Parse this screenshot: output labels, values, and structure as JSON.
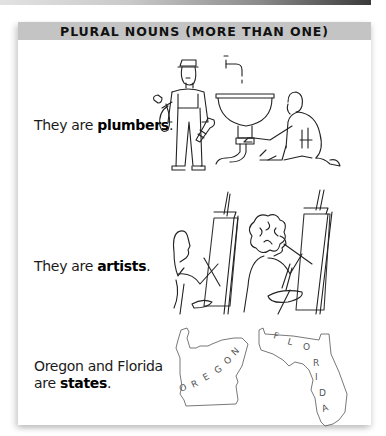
{
  "header": {
    "title": "PLURAL NOUNS (MORE THAN ONE)"
  },
  "rows": [
    {
      "text_before": "They are ",
      "bold": "plumbers",
      "text_after": ".",
      "illustration": "two-plumbers-fixing-sink"
    },
    {
      "text_before": "They are ",
      "bold": "artists",
      "text_after": ".",
      "illustration": "two-artists-painting-at-easels"
    },
    {
      "line1": "Oregon and Florida",
      "text_before": "are ",
      "bold": "states",
      "text_after": ".",
      "illustration": "oregon-and-florida-outlines",
      "map_labels": [
        "O",
        "R",
        "E",
        "G",
        "O",
        "N",
        "F",
        "L",
        "O",
        "R",
        "I",
        "D",
        "A"
      ]
    }
  ],
  "colors": {
    "header_bg": "#c4c4c4",
    "text": "#1a1a1a",
    "card_bg": "#ffffff"
  }
}
